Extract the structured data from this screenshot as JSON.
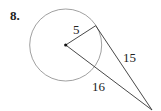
{
  "problem": {
    "number": "8."
  },
  "figure": {
    "circle": {
      "cx": 65.7,
      "cy": 45,
      "r": 36,
      "stroke": "#888888"
    },
    "center_point": {
      "x": 65.7,
      "y": 45
    },
    "tangent_point": {
      "x": 95.7,
      "y": 25.7
    },
    "external_point": {
      "x": 152,
      "y": 110
    },
    "labels": {
      "radius": "5",
      "tangent": "15",
      "secant": "16"
    }
  }
}
